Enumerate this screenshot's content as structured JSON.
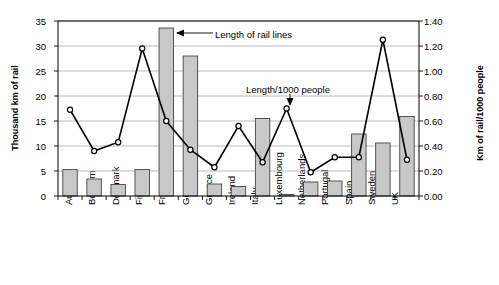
{
  "chart_data": {
    "type": "bar",
    "title": "",
    "subtitle": "",
    "categories": [
      "Austria",
      "Belgium",
      "Denmark",
      "Finland",
      "France",
      "Germany",
      "Greece",
      "Ireland",
      "Italy",
      "Luxembourg",
      "Netherlands",
      "Portugal",
      "Spain",
      "Sweden",
      "UK"
    ],
    "series": [
      {
        "name": "Length of rail lines",
        "type": "bar",
        "axis": "left",
        "unit": "Thousand km of rail",
        "values": [
          5.3,
          3.4,
          2.3,
          5.3,
          33.6,
          28.0,
          2.4,
          1.9,
          15.5,
          0.3,
          2.8,
          3.0,
          12.4,
          10.6,
          15.9
        ]
      },
      {
        "name": "Length/1000 people",
        "type": "line",
        "axis": "right",
        "unit": "Km of rail/1000 people",
        "values": [
          0.69,
          0.36,
          0.43,
          1.18,
          0.6,
          0.37,
          0.23,
          0.56,
          0.27,
          0.7,
          0.19,
          0.31,
          0.31,
          1.25,
          0.29
        ]
      }
    ],
    "xlabel": "",
    "ylabel": "Thousand km of rail",
    "ylabel_right": "Km of rail/1000 people",
    "ylim": [
      0,
      35
    ],
    "ylim_right": [
      0,
      1.4
    ],
    "yticks": [
      "0",
      "5",
      "10",
      "15",
      "20",
      "25",
      "30",
      "35"
    ],
    "yticks_right": [
      "0.00",
      "0.20",
      "0.40",
      "0.60",
      "0.80",
      "1.00",
      "1.20",
      "1.40"
    ],
    "grid": true,
    "legend_position": "inline-annotations",
    "annotations": [
      {
        "name": "bar-series-annotation",
        "text": "Length of rail lines"
      },
      {
        "name": "line-series-annotation",
        "text": "Length/1000 people"
      }
    ]
  }
}
